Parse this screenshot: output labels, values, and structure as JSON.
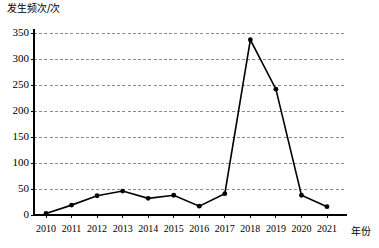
{
  "chart_data": {
    "type": "line",
    "title": "",
    "subtitle": "",
    "ylabel": "发生频次/次",
    "xlabel": "年份",
    "categories": [
      "2010",
      "2011",
      "2012",
      "2013",
      "2014",
      "2015",
      "2016",
      "2017",
      "2018",
      "2019",
      "2020",
      "2021"
    ],
    "values": [
      3,
      19,
      37,
      46,
      32,
      38,
      17,
      41,
      337,
      242,
      38,
      16
    ],
    "series": [
      {
        "name": "发生频次",
        "values": [
          3,
          19,
          37,
          46,
          32,
          38,
          17,
          41,
          337,
          242,
          38,
          16
        ]
      }
    ],
    "ylim": [
      0,
      350
    ],
    "yticks": [
      0,
      50,
      100,
      150,
      200,
      250,
      300,
      350
    ],
    "ytick_labels": [
      "0",
      "50",
      "100",
      "150",
      "200",
      "250",
      "300",
      "350"
    ],
    "grid": "horizontal-dashed",
    "legend": "none",
    "line_color": "#000000",
    "marker": "filled-circle",
    "marker_color": "#000000",
    "grid_color": "#8a8a8a",
    "axis_color": "#000000",
    "background_color": "#ffffff"
  }
}
